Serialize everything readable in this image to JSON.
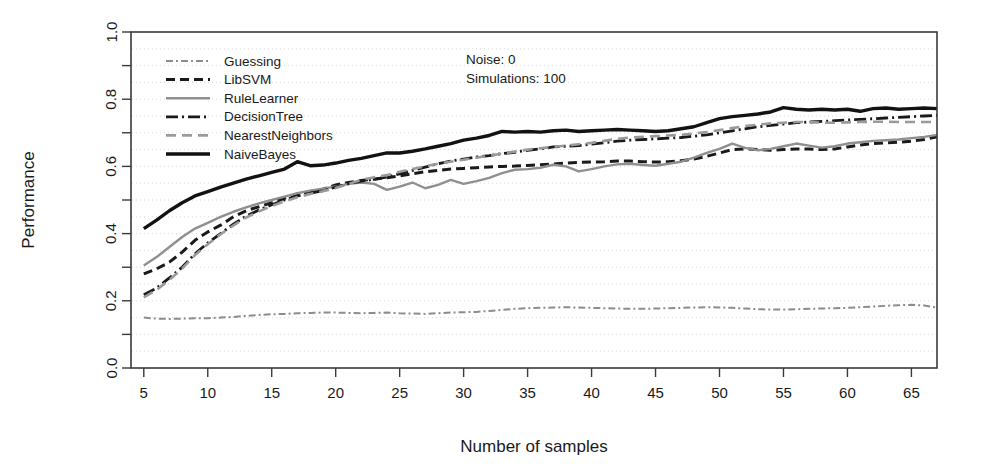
{
  "chart_data": {
    "type": "line",
    "title": "",
    "xlabel": "Number of samples",
    "ylabel": "Performance",
    "xlim": [
      4,
      67
    ],
    "ylim": [
      0.0,
      1.0
    ],
    "grid": true,
    "grid_spacing_y": 0.05,
    "legend_position": "top-left",
    "xticks": [
      5,
      10,
      15,
      20,
      25,
      30,
      35,
      40,
      45,
      50,
      55,
      60,
      65
    ],
    "xtick_labels": [
      "5",
      "10",
      "15",
      "20",
      "25",
      "30",
      "35",
      "40",
      "45",
      "50",
      "55",
      "60",
      "65"
    ],
    "yticks": [
      0.0,
      0.2,
      0.4,
      0.6,
      0.8,
      1.0
    ],
    "ytick_labels": [
      "0.0",
      "0.2",
      "0.4",
      "0.6",
      "0.8",
      "1.0"
    ],
    "yticks_minor": [
      0.1,
      0.3,
      0.5,
      0.7,
      0.9
    ],
    "x": [
      5,
      6,
      7,
      8,
      9,
      10,
      11,
      12,
      13,
      14,
      15,
      16,
      17,
      18,
      19,
      20,
      21,
      22,
      23,
      24,
      25,
      26,
      27,
      28,
      29,
      30,
      31,
      32,
      33,
      34,
      35,
      36,
      37,
      38,
      39,
      40,
      41,
      42,
      43,
      44,
      45,
      46,
      47,
      48,
      49,
      50,
      51,
      52,
      53,
      54,
      55,
      56,
      57,
      58,
      59,
      60,
      61,
      62,
      63,
      64,
      65,
      66,
      67
    ],
    "annotations": [
      {
        "name": "noise",
        "text": "Noise: 0"
      },
      {
        "name": "simulations",
        "text": "Simulations: 100"
      }
    ],
    "series": [
      {
        "name": "Guessing",
        "color": "#8c8c8c",
        "style": "dashdot-thin",
        "width": 2.0,
        "dash": "7,3,2,3",
        "values": [
          0.15,
          0.147,
          0.146,
          0.147,
          0.148,
          0.148,
          0.15,
          0.152,
          0.155,
          0.158,
          0.16,
          0.161,
          0.163,
          0.164,
          0.165,
          0.165,
          0.164,
          0.163,
          0.164,
          0.165,
          0.163,
          0.162,
          0.161,
          0.163,
          0.165,
          0.166,
          0.167,
          0.17,
          0.173,
          0.176,
          0.178,
          0.179,
          0.18,
          0.181,
          0.18,
          0.179,
          0.178,
          0.177,
          0.176,
          0.176,
          0.177,
          0.178,
          0.179,
          0.18,
          0.181,
          0.18,
          0.179,
          0.177,
          0.175,
          0.174,
          0.174,
          0.175,
          0.176,
          0.177,
          0.178,
          0.179,
          0.181,
          0.183,
          0.185,
          0.187,
          0.188,
          0.186,
          0.18
        ]
      },
      {
        "name": "LibSVM",
        "color": "#1a1a1a",
        "style": "dashed-bold",
        "width": 3.0,
        "dash": "9,5",
        "values": [
          0.28,
          0.295,
          0.315,
          0.345,
          0.38,
          0.405,
          0.425,
          0.45,
          0.468,
          0.48,
          0.492,
          0.505,
          0.518,
          0.525,
          0.532,
          0.545,
          0.552,
          0.558,
          0.562,
          0.566,
          0.572,
          0.578,
          0.584,
          0.588,
          0.592,
          0.594,
          0.596,
          0.598,
          0.6,
          0.601,
          0.603,
          0.605,
          0.607,
          0.61,
          0.612,
          0.613,
          0.614,
          0.616,
          0.616,
          0.614,
          0.613,
          0.614,
          0.617,
          0.622,
          0.63,
          0.64,
          0.65,
          0.652,
          0.65,
          0.648,
          0.65,
          0.652,
          0.652,
          0.65,
          0.652,
          0.658,
          0.664,
          0.668,
          0.67,
          0.672,
          0.675,
          0.68,
          0.688
        ]
      },
      {
        "name": "RuleLearner",
        "color": "#8f8f8f",
        "style": "solid-gray",
        "width": 2.4,
        "dash": "none",
        "values": [
          0.305,
          0.33,
          0.36,
          0.39,
          0.415,
          0.432,
          0.45,
          0.465,
          0.478,
          0.49,
          0.5,
          0.51,
          0.52,
          0.528,
          0.534,
          0.54,
          0.548,
          0.552,
          0.548,
          0.53,
          0.54,
          0.552,
          0.535,
          0.545,
          0.56,
          0.548,
          0.556,
          0.566,
          0.58,
          0.59,
          0.592,
          0.596,
          0.605,
          0.6,
          0.585,
          0.592,
          0.6,
          0.606,
          0.608,
          0.604,
          0.602,
          0.608,
          0.614,
          0.626,
          0.64,
          0.652,
          0.668,
          0.655,
          0.648,
          0.652,
          0.66,
          0.668,
          0.662,
          0.656,
          0.66,
          0.668,
          0.672,
          0.676,
          0.678,
          0.68,
          0.684,
          0.688,
          0.694
        ]
      },
      {
        "name": "DecisionTree",
        "color": "#1a1a1a",
        "style": "dashdot-bold",
        "width": 2.8,
        "dash": "12,4,2,4",
        "values": [
          0.218,
          0.238,
          0.268,
          0.3,
          0.34,
          0.372,
          0.4,
          0.428,
          0.452,
          0.47,
          0.486,
          0.5,
          0.512,
          0.52,
          0.528,
          0.538,
          0.548,
          0.556,
          0.562,
          0.568,
          0.578,
          0.588,
          0.598,
          0.608,
          0.616,
          0.622,
          0.628,
          0.632,
          0.638,
          0.642,
          0.648,
          0.652,
          0.658,
          0.66,
          0.662,
          0.666,
          0.67,
          0.675,
          0.678,
          0.68,
          0.682,
          0.684,
          0.686,
          0.69,
          0.694,
          0.7,
          0.706,
          0.712,
          0.718,
          0.722,
          0.726,
          0.73,
          0.732,
          0.734,
          0.736,
          0.738,
          0.74,
          0.742,
          0.744,
          0.746,
          0.748,
          0.75,
          0.752
        ]
      },
      {
        "name": "NearestNeighbors",
        "color": "#9a9a9a",
        "style": "dashed-gray",
        "width": 2.6,
        "dash": "10,6",
        "values": [
          0.21,
          0.232,
          0.262,
          0.296,
          0.336,
          0.368,
          0.398,
          0.424,
          0.448,
          0.466,
          0.482,
          0.496,
          0.508,
          0.518,
          0.526,
          0.536,
          0.548,
          0.56,
          0.568,
          0.574,
          0.584,
          0.592,
          0.6,
          0.608,
          0.614,
          0.62,
          0.626,
          0.632,
          0.638,
          0.644,
          0.65,
          0.654,
          0.658,
          0.662,
          0.666,
          0.67,
          0.676,
          0.682,
          0.686,
          0.688,
          0.69,
          0.692,
          0.694,
          0.698,
          0.702,
          0.708,
          0.714,
          0.72,
          0.724,
          0.728,
          0.73,
          0.732,
          0.732,
          0.73,
          0.73,
          0.731,
          0.732,
          0.733,
          0.733,
          0.732,
          0.732,
          0.732,
          0.732
        ]
      },
      {
        "name": "NaiveBayes",
        "color": "#121212",
        "style": "solid-bold",
        "width": 3.4,
        "dash": "none",
        "values": [
          0.415,
          0.44,
          0.468,
          0.492,
          0.512,
          0.525,
          0.538,
          0.55,
          0.562,
          0.572,
          0.582,
          0.592,
          0.614,
          0.602,
          0.604,
          0.61,
          0.618,
          0.624,
          0.632,
          0.64,
          0.64,
          0.645,
          0.652,
          0.66,
          0.668,
          0.678,
          0.684,
          0.692,
          0.704,
          0.702,
          0.704,
          0.702,
          0.706,
          0.708,
          0.704,
          0.706,
          0.708,
          0.71,
          0.708,
          0.706,
          0.704,
          0.706,
          0.712,
          0.718,
          0.73,
          0.742,
          0.748,
          0.752,
          0.756,
          0.762,
          0.775,
          0.77,
          0.768,
          0.77,
          0.768,
          0.77,
          0.764,
          0.772,
          0.774,
          0.77,
          0.772,
          0.774,
          0.772
        ]
      }
    ]
  }
}
